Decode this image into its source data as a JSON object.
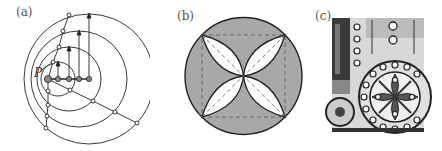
{
  "figure": {
    "panels": [
      {
        "id": "a",
        "label": "(a)",
        "point_label": "P",
        "description": "Concentric-like nested circles with center points, arrows and polyline chains"
      },
      {
        "id": "b",
        "label": "(b)",
        "description": "Grey circle with inscribed four-petal rosette and dashed square with diagonals"
      },
      {
        "id": "c",
        "label": "(c)",
        "description": "Photograph of ornamental tile with circular rosette pattern and dotted rings"
      }
    ],
    "colors": {
      "stroke": "#222222",
      "fill_grey": "#a8a8a8",
      "dot_grey": "#888888",
      "dash": "#555555"
    }
  }
}
